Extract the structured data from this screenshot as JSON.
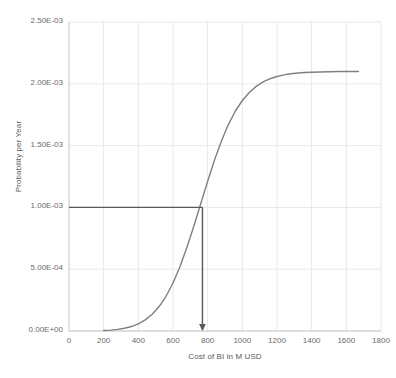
{
  "chart_data": {
    "type": "line",
    "title": "",
    "xlabel": "Cost of BI in M USD",
    "ylabel": "Probability per Year",
    "xlim": [
      0,
      1800
    ],
    "ylim": [
      0,
      0.0025
    ],
    "xticks": [
      0,
      200,
      400,
      600,
      800,
      1000,
      1200,
      1400,
      1600,
      1800
    ],
    "xtick_labels": [
      "0",
      "200",
      "400",
      "600",
      "800",
      "1000",
      "1200",
      "1400",
      "1600",
      "1800"
    ],
    "yticks": [
      0,
      0.0005,
      0.001,
      0.0015,
      0.002,
      0.0025
    ],
    "ytick_labels": [
      "0.00E+00",
      "5.00E-04",
      "1.00E-03",
      "1.50E-03",
      "2.00E-03",
      "2.50E-03"
    ],
    "grid": true,
    "grid_color": "#e8e8e8",
    "legend": false,
    "series": [
      {
        "name": "Cumulative probability curve",
        "color": "#808080",
        "x": [
          200,
          240,
          280,
          320,
          360,
          400,
          440,
          480,
          520,
          560,
          600,
          640,
          680,
          720,
          760,
          800,
          840,
          880,
          920,
          960,
          1000,
          1040,
          1080,
          1120,
          1160,
          1200,
          1240,
          1280,
          1320,
          1360,
          1400,
          1450,
          1500,
          1560,
          1620,
          1670
        ],
        "y": [
          4e-06,
          7e-06,
          1.3e-05,
          2.2e-05,
          3.6e-05,
          5.8e-05,
          9e-05,
          0.000135,
          0.000198,
          0.000281,
          0.000388,
          0.00052,
          0.000675,
          0.000848,
          0.00103,
          0.001212,
          0.001385,
          0.00154,
          0.001672,
          0.00178,
          0.001865,
          0.00193,
          0.001979,
          0.002015,
          0.002041,
          0.002059,
          0.002072,
          0.002081,
          0.002087,
          0.002091,
          0.002094,
          0.002096,
          0.002098,
          0.002099,
          0.0021,
          0.0021
        ]
      }
    ],
    "annotations": [
      {
        "name": "reference-probability-line",
        "type": "horizontal-line",
        "y": 0.001,
        "x_start": 0,
        "x_end": 770,
        "color": "#595959"
      },
      {
        "name": "reference-cost-arrow",
        "type": "vertical-arrow",
        "x": 770,
        "y_start": 0.001,
        "y_end": 0,
        "color": "#595959"
      }
    ]
  }
}
